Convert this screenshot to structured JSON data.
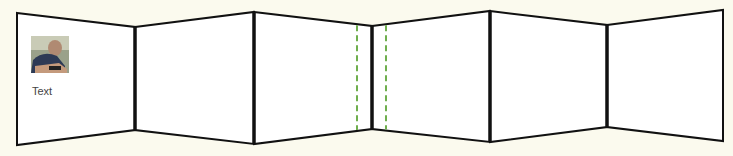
{
  "diagram": {
    "background": "#fbfaee",
    "panel_fill": "#ffffff",
    "stroke": "#111111",
    "guide_color": "#6fae4e",
    "vertices": [
      {
        "x": 17,
        "top": 13,
        "bottom": 145
      },
      {
        "x": 135,
        "top": 27,
        "bottom": 130
      },
      {
        "x": 254,
        "top": 12,
        "bottom": 144
      },
      {
        "x": 372,
        "top": 26,
        "bottom": 129
      },
      {
        "x": 490,
        "top": 11,
        "bottom": 142
      },
      {
        "x": 607,
        "top": 25,
        "bottom": 127
      },
      {
        "x": 723,
        "top": 10,
        "bottom": 141
      }
    ],
    "panels": [
      {
        "index": 1,
        "caption": "Text",
        "has_photo": true
      },
      {
        "index": 2
      },
      {
        "index": 3
      },
      {
        "index": 4
      },
      {
        "index": 5
      },
      {
        "index": 6
      }
    ],
    "dashed_guides": [
      {
        "x": 357
      },
      {
        "x": 386
      }
    ]
  }
}
